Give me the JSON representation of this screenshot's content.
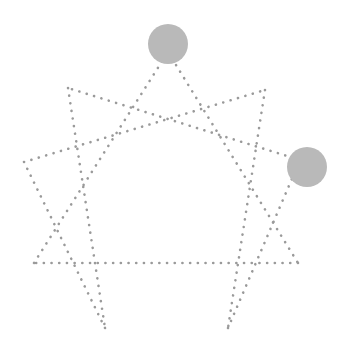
{
  "diagram": {
    "type": "enneagram",
    "background": "#ffffff",
    "line_color": "#9a9a9a",
    "marker_color": "#b9b9b9",
    "points": [
      {
        "id": "9",
        "x": 168,
        "y": 52
      },
      {
        "id": "1",
        "x": 265,
        "y": 90
      },
      {
        "id": "2",
        "x": 300,
        "y": 160
      },
      {
        "id": "3",
        "x": 298,
        "y": 263
      },
      {
        "id": "4",
        "x": 228,
        "y": 328
      },
      {
        "id": "5",
        "x": 105,
        "y": 328
      },
      {
        "id": "6",
        "x": 34,
        "y": 263
      },
      {
        "id": "7",
        "x": 24,
        "y": 162
      },
      {
        "id": "8",
        "x": 68,
        "y": 88
      }
    ],
    "triangle": [
      "9",
      "3",
      "6"
    ],
    "hexad": [
      "1",
      "4",
      "2",
      "8",
      "5",
      "7"
    ],
    "markers": [
      {
        "name": "top-marker",
        "cx": 168,
        "cy": 44,
        "r": 20
      },
      {
        "name": "right-marker",
        "cx": 307,
        "cy": 167,
        "r": 20
      }
    ]
  }
}
